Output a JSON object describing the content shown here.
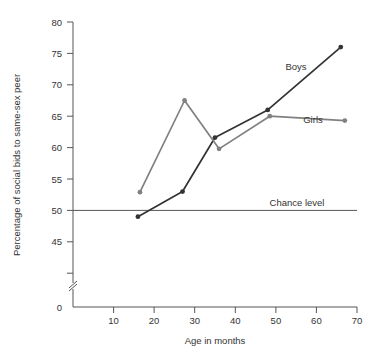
{
  "chart_data": {
    "type": "line",
    "title": "",
    "xlabel": "Age in months",
    "ylabel": "Percentage of social bids to same-sex peer",
    "xlim": [
      0,
      70
    ],
    "ylim": [
      43,
      80
    ],
    "grid": false,
    "legend_position": "inline-labels",
    "x_ticks": [
      10,
      20,
      30,
      40,
      50,
      60,
      70
    ],
    "y_ticks": [
      0,
      45,
      50,
      55,
      60,
      65,
      70,
      75,
      80
    ],
    "y_axis_break": true,
    "series": [
      {
        "name": "Boys",
        "color": "#333333",
        "x": [
          16,
          27,
          35,
          48,
          66
        ],
        "values": [
          49,
          53,
          61.6,
          66,
          76
        ]
      },
      {
        "name": "Girls",
        "color": "#808080",
        "x": [
          16.5,
          27.5,
          36,
          48.5,
          67
        ],
        "values": [
          52.9,
          67.5,
          59.8,
          65,
          64.3
        ]
      }
    ],
    "annotations": [
      {
        "text": "Boys",
        "x": 55,
        "y": 72.7
      },
      {
        "text": "Girls",
        "x": 58,
        "y": 66.6
      },
      {
        "text": "Chance level",
        "x": 55,
        "y": 51.3
      },
      {
        "text": "Chance level line",
        "value": 50
      }
    ]
  },
  "axes": {
    "x_title": "Age in months",
    "y_title": "Percentage of social bids to same-sex peer",
    "x_tick_labels": [
      "10",
      "20",
      "30",
      "40",
      "50",
      "60",
      "70"
    ],
    "y_tick_labels": [
      "0",
      "45",
      "50",
      "55",
      "60",
      "65",
      "70",
      "75",
      "80"
    ]
  },
  "labels": {
    "boys": "Boys",
    "girls": "Girls",
    "chance_level": "Chance level"
  },
  "colors": {
    "boys_line": "#333333",
    "girls_line": "#808080",
    "axis": "#555555",
    "background": "#ffffff"
  }
}
